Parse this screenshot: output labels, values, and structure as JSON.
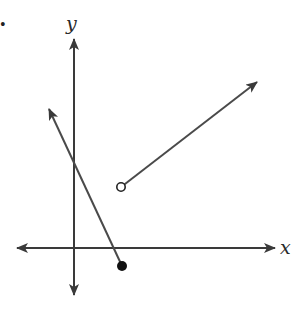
{
  "figure": {
    "bullet": "•",
    "axes": {
      "x_label": "x",
      "y_label": "y",
      "origin": [
        74,
        248
      ],
      "x_axis": {
        "from": [
          17,
          248
        ],
        "to": [
          275,
          248
        ]
      },
      "y_axis": {
        "from": [
          74,
          39
        ],
        "to": [
          74,
          295
        ]
      }
    },
    "rays": [
      {
        "name": "ray-from-open-point",
        "start": [
          121,
          187
        ],
        "end": [
          257,
          82
        ],
        "start_marker": "open-circle"
      },
      {
        "name": "ray-from-closed-point",
        "start": [
          122,
          266
        ],
        "end": [
          49,
          109
        ],
        "start_marker": "filled-circle"
      }
    ],
    "colors": {
      "line": "#4a4a4a",
      "axis": "#3a3a3a",
      "point_fill": "#111111",
      "background": "#ffffff"
    }
  }
}
